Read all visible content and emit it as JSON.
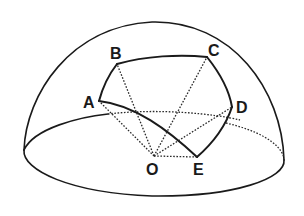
{
  "figure": {
    "center_label": "O",
    "vertex_labels": [
      "A",
      "B",
      "C",
      "D",
      "E"
    ],
    "sides": [
      "AB",
      "BC",
      "CD",
      "DE",
      "EA"
    ],
    "radii": [
      "OA",
      "OB",
      "OC",
      "OD",
      "OE"
    ],
    "colors": {
      "ink": "#1a1a1a",
      "background": "#ffffff"
    }
  }
}
